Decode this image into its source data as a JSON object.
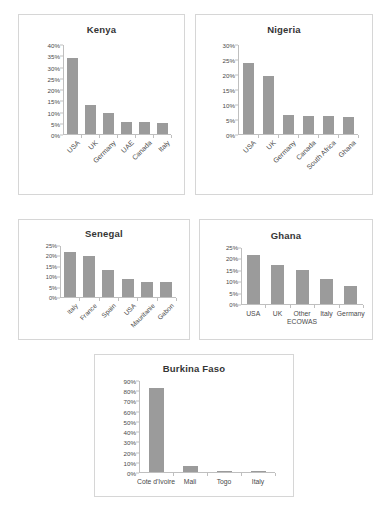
{
  "page": {
    "background": "#ffffff",
    "bar_color": "#9b9b9b",
    "axis_color": "#bfbfbf",
    "panel_border": "#d6d6d6"
  },
  "chart_data": [
    {
      "type": "bar",
      "title": "Kenya",
      "xlabel": "",
      "ylabel": "",
      "categories": [
        "USA",
        "UK",
        "Germany",
        "UAE",
        "Canada",
        "Italy"
      ],
      "values": [
        34,
        13,
        9.5,
        5.5,
        5.2,
        4.8
      ],
      "ylim": [
        0,
        40
      ],
      "ytick_step": 5,
      "ytick_labels": [
        "0%",
        "5%",
        "10%",
        "15%",
        "20%",
        "25%",
        "30%",
        "35%",
        "40%"
      ],
      "grid": false,
      "legend": "none",
      "label_rotation": -45
    },
    {
      "type": "bar",
      "title": "Nigeria",
      "xlabel": "",
      "ylabel": "",
      "categories": [
        "USA",
        "UK",
        "Germany",
        "Canada",
        "South Africa",
        "Ghana"
      ],
      "values": [
        24,
        19.5,
        6.3,
        6.2,
        6.0,
        5.7
      ],
      "ylim": [
        0,
        30
      ],
      "ytick_step": 5,
      "ytick_labels": [
        "0%",
        "5%",
        "10%",
        "15%",
        "20%",
        "25%",
        "30%"
      ],
      "grid": false,
      "legend": "none",
      "label_rotation": -45
    },
    {
      "type": "bar",
      "title": "Senegal",
      "xlabel": "",
      "ylabel": "",
      "categories": [
        "Italy",
        "France",
        "Spain",
        "USA",
        "Mauritanie",
        "Gabon"
      ],
      "values": [
        22,
        20,
        13,
        9,
        7.5,
        7.5
      ],
      "ylim": [
        0,
        25
      ],
      "ytick_step": 5,
      "ytick_labels": [
        "0%",
        "5%",
        "10%",
        "15%",
        "20%",
        "25%"
      ],
      "grid": false,
      "legend": "none",
      "label_rotation": -45
    },
    {
      "type": "bar",
      "title": "Ghana",
      "xlabel": "",
      "ylabel": "",
      "categories": [
        "USA",
        "UK",
        "Other ECOWAS",
        "Italy",
        "Germany"
      ],
      "values": [
        22,
        17.5,
        15.3,
        11,
        8.2
      ],
      "ylim": [
        0,
        25
      ],
      "ytick_step": 5,
      "ytick_labels": [
        "0%",
        "5%",
        "10%",
        "15%",
        "20%",
        "25%"
      ],
      "grid": false,
      "legend": "none",
      "label_rotation": 0
    },
    {
      "type": "bar",
      "title": "Burkina Faso",
      "xlabel": "",
      "ylabel": "",
      "categories": [
        "Cote d'Ivoire",
        "Mali",
        "Togo",
        "Italy"
      ],
      "values": [
        83,
        6,
        1,
        1
      ],
      "ylim": [
        0,
        90
      ],
      "ytick_step": 10,
      "ytick_labels": [
        "0%",
        "10%",
        "20%",
        "30%",
        "40%",
        "50%",
        "60%",
        "70%",
        "80%",
        "90%"
      ],
      "grid": false,
      "legend": "none",
      "label_rotation": 0
    }
  ]
}
